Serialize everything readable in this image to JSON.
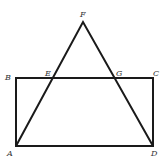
{
  "diagram": {
    "stroke_color": "#1a1a1a",
    "label_color": "#333333",
    "points": {
      "A": {
        "x": 16,
        "y": 146
      },
      "B": {
        "x": 16,
        "y": 78
      },
      "C": {
        "x": 153,
        "y": 78
      },
      "D": {
        "x": 153,
        "y": 146
      },
      "E": {
        "x": 52,
        "y": 78
      },
      "F": {
        "x": 83,
        "y": 22
      },
      "G": {
        "x": 115,
        "y": 78
      }
    },
    "labels": {
      "A": "A",
      "B": "B",
      "C": "C",
      "D": "D",
      "E": "E",
      "F": "F",
      "G": "G"
    },
    "shapes": [
      {
        "type": "rectangle",
        "vertices": [
          "A",
          "B",
          "C",
          "D"
        ]
      },
      {
        "type": "triangle",
        "vertices": [
          "A",
          "F",
          "D"
        ]
      }
    ]
  }
}
